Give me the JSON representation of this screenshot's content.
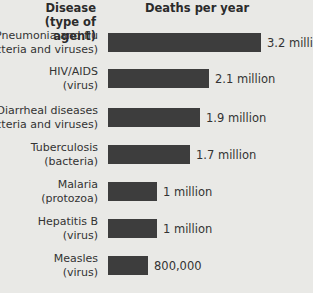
{
  "headers": {
    "disease_line1": "Disease",
    "disease_line2": "(type of agent)",
    "deaths": "Deaths per year"
  },
  "rows": [
    {
      "name": "Pneumonia and flu",
      "agent": "(bacteria and viruses)",
      "value_label": "3.2 million"
    },
    {
      "name": "HIV/AIDS",
      "agent": "(virus)",
      "value_label": "2.1 million"
    },
    {
      "name": "Diarrheal diseases",
      "agent": "(bacteria and viruses)",
      "value_label": "1.9 million"
    },
    {
      "name": "Tuberculosis",
      "agent": "(bacteria)",
      "value_label": "1.7 million"
    },
    {
      "name": "Malaria",
      "agent": "(protozoa)",
      "value_label": "1 million"
    },
    {
      "name": "Hepatitis B",
      "agent": "(virus)",
      "value_label": "1 million"
    },
    {
      "name": "Measles",
      "agent": "(virus)",
      "value_label": "800,000"
    }
  ],
  "colors": {
    "bar": "#3d3d3d",
    "background": "#e9e9e6"
  },
  "chart_data": {
    "type": "bar",
    "orientation": "horizontal",
    "title": "",
    "xlabel": "Deaths per year",
    "ylabel": "Disease (type of agent)",
    "categories": [
      "Pneumonia and flu (bacteria and viruses)",
      "HIV/AIDS (virus)",
      "Diarrheal diseases (bacteria and viruses)",
      "Tuberculosis (bacteria)",
      "Malaria (protozoa)",
      "Hepatitis B (virus)",
      "Measles (virus)"
    ],
    "values": [
      3200000,
      2100000,
      1900000,
      1700000,
      1000000,
      1000000,
      800000
    ],
    "value_labels": [
      "3.2 million",
      "2.1 million",
      "1.9 million",
      "1.7 million",
      "1 million",
      "1 million",
      "800,000"
    ],
    "grid": false,
    "legend": null
  }
}
